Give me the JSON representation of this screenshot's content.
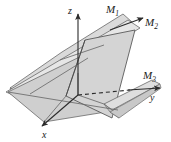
{
  "figure": {
    "kind": "3d-geometry-diagram",
    "background_color": "#ffffff",
    "axes": [
      {
        "id": "z",
        "label": "z",
        "sub": "",
        "direction": "up",
        "style": "solid-arrow"
      },
      {
        "id": "y",
        "label": "y",
        "sub": "",
        "direction": "right",
        "style": "solid-arrow"
      },
      {
        "id": "x",
        "label": "x",
        "sub": "",
        "direction": "down-left",
        "style": "solid-arrow"
      }
    ],
    "planes": [
      {
        "id": "M1",
        "label": "M",
        "sub": "1",
        "fill": "#d2d2d2"
      },
      {
        "id": "M2",
        "label": "M",
        "sub": "2",
        "fill": "#dcdcdc"
      },
      {
        "id": "M3",
        "label": "M",
        "sub": "3",
        "fill": "#cfcfcf"
      }
    ],
    "colors": {
      "line": "#2b2b2b",
      "edge": "#6a6a6a",
      "fill_light": "#e2e2e2",
      "fill_mid": "#d2d2d2",
      "fill_dark": "#c2c2c2",
      "label": "#1a1a1a"
    }
  }
}
